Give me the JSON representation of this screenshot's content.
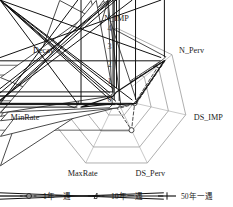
{
  "chart_data": {
    "type": "radar",
    "title": "",
    "subtitle": "",
    "xlabel": "",
    "ylabel": "",
    "grid": true,
    "legend_position": "bottom",
    "rlim": [
      0,
      4
    ],
    "ticks": [
      "0",
      "1",
      "2",
      "3",
      "4"
    ],
    "tick_axis": "N_IMP",
    "categories": [
      "N_IMP",
      "N_Perv",
      "DS_IMP",
      "DS_Perv",
      "MaxRate",
      "MinRate",
      "Decay"
    ],
    "series": [
      {
        "name": "1年一遇",
        "marker": "circle",
        "linestyle": "dashed",
        "color": "#2b2b2b",
        "values": [
          1.35,
          3.05,
          1.05,
          1.95,
          0.3,
          0.45,
          0.3
        ]
      },
      {
        "name": "10年一遇",
        "marker": "triangle",
        "linestyle": "dashed",
        "color": "#2b2b2b",
        "values": [
          0.45,
          3.55,
          1.15,
          0.55,
          0.55,
          2.25,
          0.25
        ]
      },
      {
        "name": "50年一遇",
        "marker": "star-x",
        "linestyle": "solid",
        "color": "#111111",
        "values": [
          0.4,
          3.45,
          1.1,
          0.35,
          0.3,
          2.05,
          0.25
        ]
      }
    ]
  },
  "axes": {
    "labels": [
      {
        "key": "n-imp",
        "text": "N_IMP"
      },
      {
        "key": "n-perv",
        "text": "N_Perv"
      },
      {
        "key": "ds-imp",
        "text": "DS_IMP"
      },
      {
        "key": "ds-perv",
        "text": "DS_Perv"
      },
      {
        "key": "max-rate",
        "text": "MaxRate"
      },
      {
        "key": "min-rate",
        "text": "MinRate"
      },
      {
        "key": "decay",
        "text": "Decay"
      }
    ]
  },
  "radial_ticks": [
    {
      "key": "tick-0",
      "text": "0"
    },
    {
      "key": "tick-1",
      "text": "1"
    },
    {
      "key": "tick-2",
      "text": "2"
    },
    {
      "key": "tick-3",
      "text": "3"
    },
    {
      "key": "tick-4",
      "text": "4"
    }
  ],
  "legend": {
    "items": [
      {
        "key": "legend-1yr",
        "label": "1年一遇",
        "marker": "circle",
        "linestyle": "dashed"
      },
      {
        "key": "legend-10yr",
        "label": "10年一遇",
        "marker": "triangle",
        "linestyle": "dashed"
      },
      {
        "key": "legend-50yr",
        "label": "50年一遇",
        "marker": "star-x",
        "linestyle": "solid"
      }
    ]
  },
  "colors": {
    "grid": "#8c8c8c",
    "spoke": "#9a9a9a",
    "text": "#1a1a1a",
    "series_1yr": "#2b2b2b",
    "series_10yr": "#2b2b2b",
    "series_50yr": "#111111",
    "background": "#ffffff"
  }
}
